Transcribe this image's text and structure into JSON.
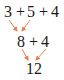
{
  "diagram": {
    "title": "",
    "arrow_color": "#e8804e",
    "rows": [
      {
        "tokens": [
          "3",
          "+",
          "5",
          "+",
          "4"
        ]
      },
      {
        "tokens": [
          "8",
          "+",
          "4"
        ]
      },
      {
        "tokens": [
          "12"
        ]
      }
    ],
    "steps": [
      {
        "from": [
          "3",
          "5"
        ],
        "to": "8"
      },
      {
        "from": [
          "8",
          "4"
        ],
        "to": "12"
      }
    ]
  }
}
